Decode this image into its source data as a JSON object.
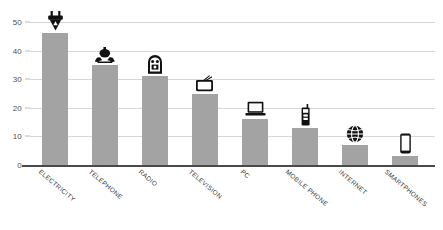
{
  "chart_data": {
    "type": "bar",
    "title": "",
    "xlabel": "",
    "ylabel": "",
    "ylim": [
      0,
      50
    ],
    "grid": true,
    "legend": "none",
    "categories": [
      "ELECTRICITY",
      "TELEPHONE",
      "RADIO",
      "TELEVISION",
      "PC",
      "MOBILE PHONE",
      "INTERNET",
      "SMARTPHONES"
    ],
    "values": [
      46,
      35,
      31,
      25,
      16,
      13,
      7,
      3
    ],
    "yticks": [
      0,
      10,
      20,
      30,
      40,
      50
    ],
    "ytick_labels": [
      "0",
      "10",
      "20",
      "30",
      "40",
      "50"
    ],
    "icons": [
      "power-plug-icon",
      "telephone-icon",
      "radio-icon",
      "television-icon",
      "laptop-icon",
      "mobile-phone-icon",
      "globe-internet-icon",
      "smartphone-icon"
    ],
    "bar_color": "#a3a3a3",
    "gridline_color": "#d7d7d7",
    "axis_color": "#4a4a4a",
    "icon_color": "#1a1a1a"
  }
}
